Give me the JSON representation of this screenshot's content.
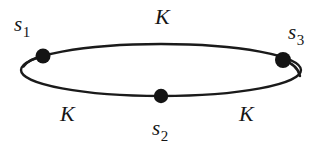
{
  "figure": {
    "background_color": "#ffffff",
    "stroke_color": "#1a1a1a",
    "node_color": "#141414",
    "ellipse": {
      "cx": 161,
      "cy": 70,
      "rx": 140,
      "ry": 26,
      "stroke_width": 2.4
    },
    "nodes": [
      {
        "id": "s1",
        "label_base": "s",
        "label_sub": "1",
        "cx": 43,
        "cy": 56,
        "r": 7.5,
        "label_x": 14,
        "label_y": 14
      },
      {
        "id": "s2",
        "label_base": "s",
        "label_sub": "2",
        "cx": 161,
        "cy": 96,
        "r": 7.2,
        "label_x": 152,
        "label_y": 118
      },
      {
        "id": "s3",
        "label_base": "s",
        "label_sub": "3",
        "cx": 283,
        "cy": 60,
        "r": 8,
        "label_x": 288,
        "label_y": 22
      }
    ],
    "edge_labels": [
      {
        "id": "k-top",
        "text": "K",
        "x": 155,
        "y": 6
      },
      {
        "id": "k-bottom-left",
        "text": "K",
        "x": 60,
        "y": 103
      },
      {
        "id": "k-bottom-right",
        "text": "K",
        "x": 239,
        "y": 103
      }
    ]
  }
}
